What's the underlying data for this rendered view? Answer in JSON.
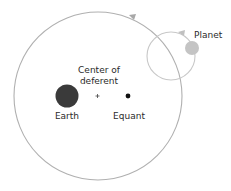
{
  "diagram": {
    "labels": {
      "planet": "Planet",
      "center_line1": "Center of",
      "center_line2": "deferent",
      "earth": "Earth",
      "equant": "Equant"
    },
    "colors": {
      "deferent": "#b0b0b0",
      "epicycle": "#c8c8c8",
      "planet": "#c4c4c4",
      "earth": "#3a3a3a",
      "equant": "#111111",
      "text": "#2a2a2a"
    }
  }
}
